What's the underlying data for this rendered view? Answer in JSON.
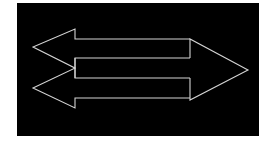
{
  "figure": {
    "background_color": "#ffffff",
    "panel_color": "#000000",
    "stroke_color": "#d8d8d8",
    "panel": {
      "x": 17,
      "y": 3,
      "width": 242,
      "height": 133
    },
    "shapes": [
      {
        "name": "left-arrow-upper",
        "direction": "left"
      },
      {
        "name": "left-arrow-lower",
        "direction": "left"
      },
      {
        "name": "right-arrow",
        "direction": "right"
      }
    ],
    "outline_points": "75,29 75,39 190,39 190,58 75,58 75,70 33,88 75,107 75,98 190,98 190,100 248,70 190,39"
  }
}
